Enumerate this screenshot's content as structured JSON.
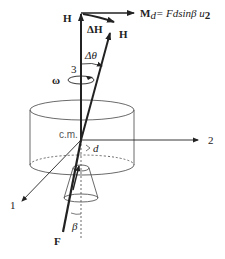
{
  "diagram": {
    "labels": {
      "H_initial": "H",
      "delta_H": "ΔH",
      "H_final": "H",
      "moment_lhs": "M",
      "moment_sub": "d",
      "moment_rhs": "= Fdsinβ u",
      "moment_u_sub": "2",
      "delta_theta": "Δθ",
      "axis3": "3",
      "omega": "ω",
      "cm": "c.m.",
      "axis2": "2",
      "d": "d",
      "axis1": "1",
      "force": "F",
      "beta": "β"
    },
    "colors": {
      "stroke": "#222222",
      "thin": "#444444",
      "cm_text": "#555555"
    }
  }
}
